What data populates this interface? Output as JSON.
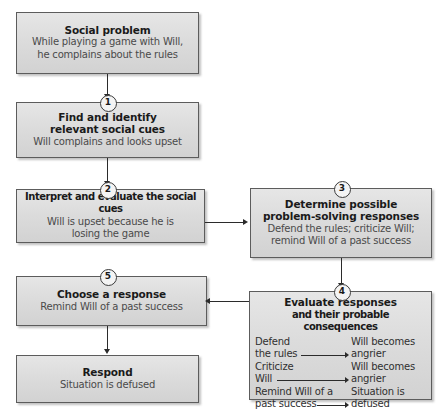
{
  "diagram": {
    "colors": {
      "box_fill_top": "#e6e6e6",
      "box_fill_bottom": "#d2d2d2",
      "box_border": "#5c5c5c",
      "heading_text": "#1a1a1a",
      "subtitle_text": "#4a4a4a",
      "connector": "#2b2b2b"
    },
    "nodes": [
      {
        "id": "social-problem",
        "step": "",
        "title": "Social problem",
        "sub_lines": [
          "While playing a game with Will,",
          "he complains about the rules"
        ]
      },
      {
        "id": "find-identify-cues",
        "step": "1",
        "title_lines": [
          "Find and identify",
          "relevant social cues"
        ],
        "sub_lines": [
          "Will complains and looks upset"
        ]
      },
      {
        "id": "interpret-evaluate-cues",
        "step": "2",
        "title_lines": [
          "Interpret and evaluate the social cues"
        ],
        "sub_lines": [
          "Will is upset because he is",
          "losing the game"
        ]
      },
      {
        "id": "determine-responses",
        "step": "3",
        "title_lines": [
          "Determine possible",
          "problem-solving responses"
        ],
        "sub_lines": [
          "Defend the rules; criticize Will;",
          "remind Will of a past success"
        ]
      },
      {
        "id": "evaluate-responses",
        "step": "4",
        "title_lines": [
          "Evaluate responses",
          "and their probable consequences"
        ],
        "matrix": [
          {
            "left_lines": [
              "Defend",
              "the rules"
            ],
            "right_lines": [
              "Will becomes",
              "angrier"
            ]
          },
          {
            "left_lines": [
              "Criticize",
              "Will"
            ],
            "right_lines": [
              "Will becomes",
              "angrier"
            ]
          },
          {
            "left_lines": [
              "Remind Will of a",
              "past success"
            ],
            "right_lines": [
              "Situation is",
              "defused"
            ]
          }
        ]
      },
      {
        "id": "choose-response",
        "step": "5",
        "title_lines": [
          "Choose a response"
        ],
        "sub_lines": [
          "Remind Will of a past success"
        ]
      },
      {
        "id": "respond",
        "step": "",
        "title_lines": [
          "Respond"
        ],
        "sub_lines": [
          "Situation is defused"
        ]
      }
    ]
  }
}
